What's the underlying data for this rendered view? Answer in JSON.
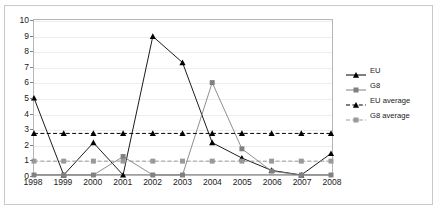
{
  "chart_data": {
    "type": "line",
    "title": "",
    "xlabel": "",
    "ylabel": "",
    "grid": true,
    "legend_position": "right",
    "categories": [
      "1998",
      "1999",
      "2000",
      "2001",
      "2002",
      "2003",
      "2004",
      "2005",
      "2006",
      "2007",
      "2008"
    ],
    "ylim": [
      0,
      10
    ],
    "yticks": [
      0,
      1,
      2,
      3,
      4,
      5,
      6,
      7,
      8,
      9,
      10
    ],
    "ytick_labels": [
      "0",
      "1",
      "2",
      "3",
      "4",
      "5",
      "6",
      "7",
      "8",
      "9",
      "10"
    ],
    "series": [
      {
        "name": "EU",
        "values": [
          5,
          0,
          2.1,
          0,
          9,
          7.3,
          2.1,
          1.1,
          0.3,
          0,
          1.4
        ],
        "color": "#000000",
        "marker": "triangle",
        "dash": "solid"
      },
      {
        "name": "G8",
        "values": [
          0,
          0,
          0,
          1.2,
          0,
          0,
          6,
          1.7,
          0.25,
          0,
          0
        ],
        "color": "#808080",
        "marker": "square",
        "dash": "solid"
      },
      {
        "name": "EU average",
        "values": [
          2.7,
          2.7,
          2.7,
          2.7,
          2.7,
          2.7,
          2.7,
          2.7,
          2.7,
          2.7,
          2.7
        ],
        "color": "#000000",
        "marker": "triangle",
        "dash": "dashed"
      },
      {
        "name": "G8 average",
        "values": [
          0.9,
          0.9,
          0.9,
          0.9,
          0.9,
          0.9,
          0.9,
          0.9,
          0.9,
          0.9,
          0.9
        ],
        "color": "#999999",
        "marker": "square",
        "dash": "dashed"
      }
    ]
  },
  "legend": {
    "entries": [
      {
        "label": "EU"
      },
      {
        "label": "G8"
      },
      {
        "label": "EU average"
      },
      {
        "label": "G8 average"
      }
    ]
  }
}
